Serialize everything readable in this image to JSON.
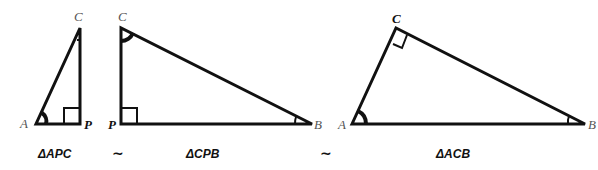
{
  "figure": {
    "triangles": [
      {
        "id": "APC",
        "caption": "ΔAPC",
        "vertices": {
          "A": "A",
          "P": "P",
          "C": "C"
        },
        "right_angle_at": "P"
      },
      {
        "id": "CPB",
        "caption": "ΔCPB",
        "vertices": {
          "C": "C",
          "P": "P",
          "B": "B"
        },
        "right_angle_at": "P"
      },
      {
        "id": "ACB",
        "caption": "ΔACB",
        "vertices": {
          "A": "A",
          "C": "C",
          "B": "B"
        },
        "right_angle_at": "C"
      }
    ],
    "similarity_symbols": [
      "~",
      "~"
    ]
  }
}
